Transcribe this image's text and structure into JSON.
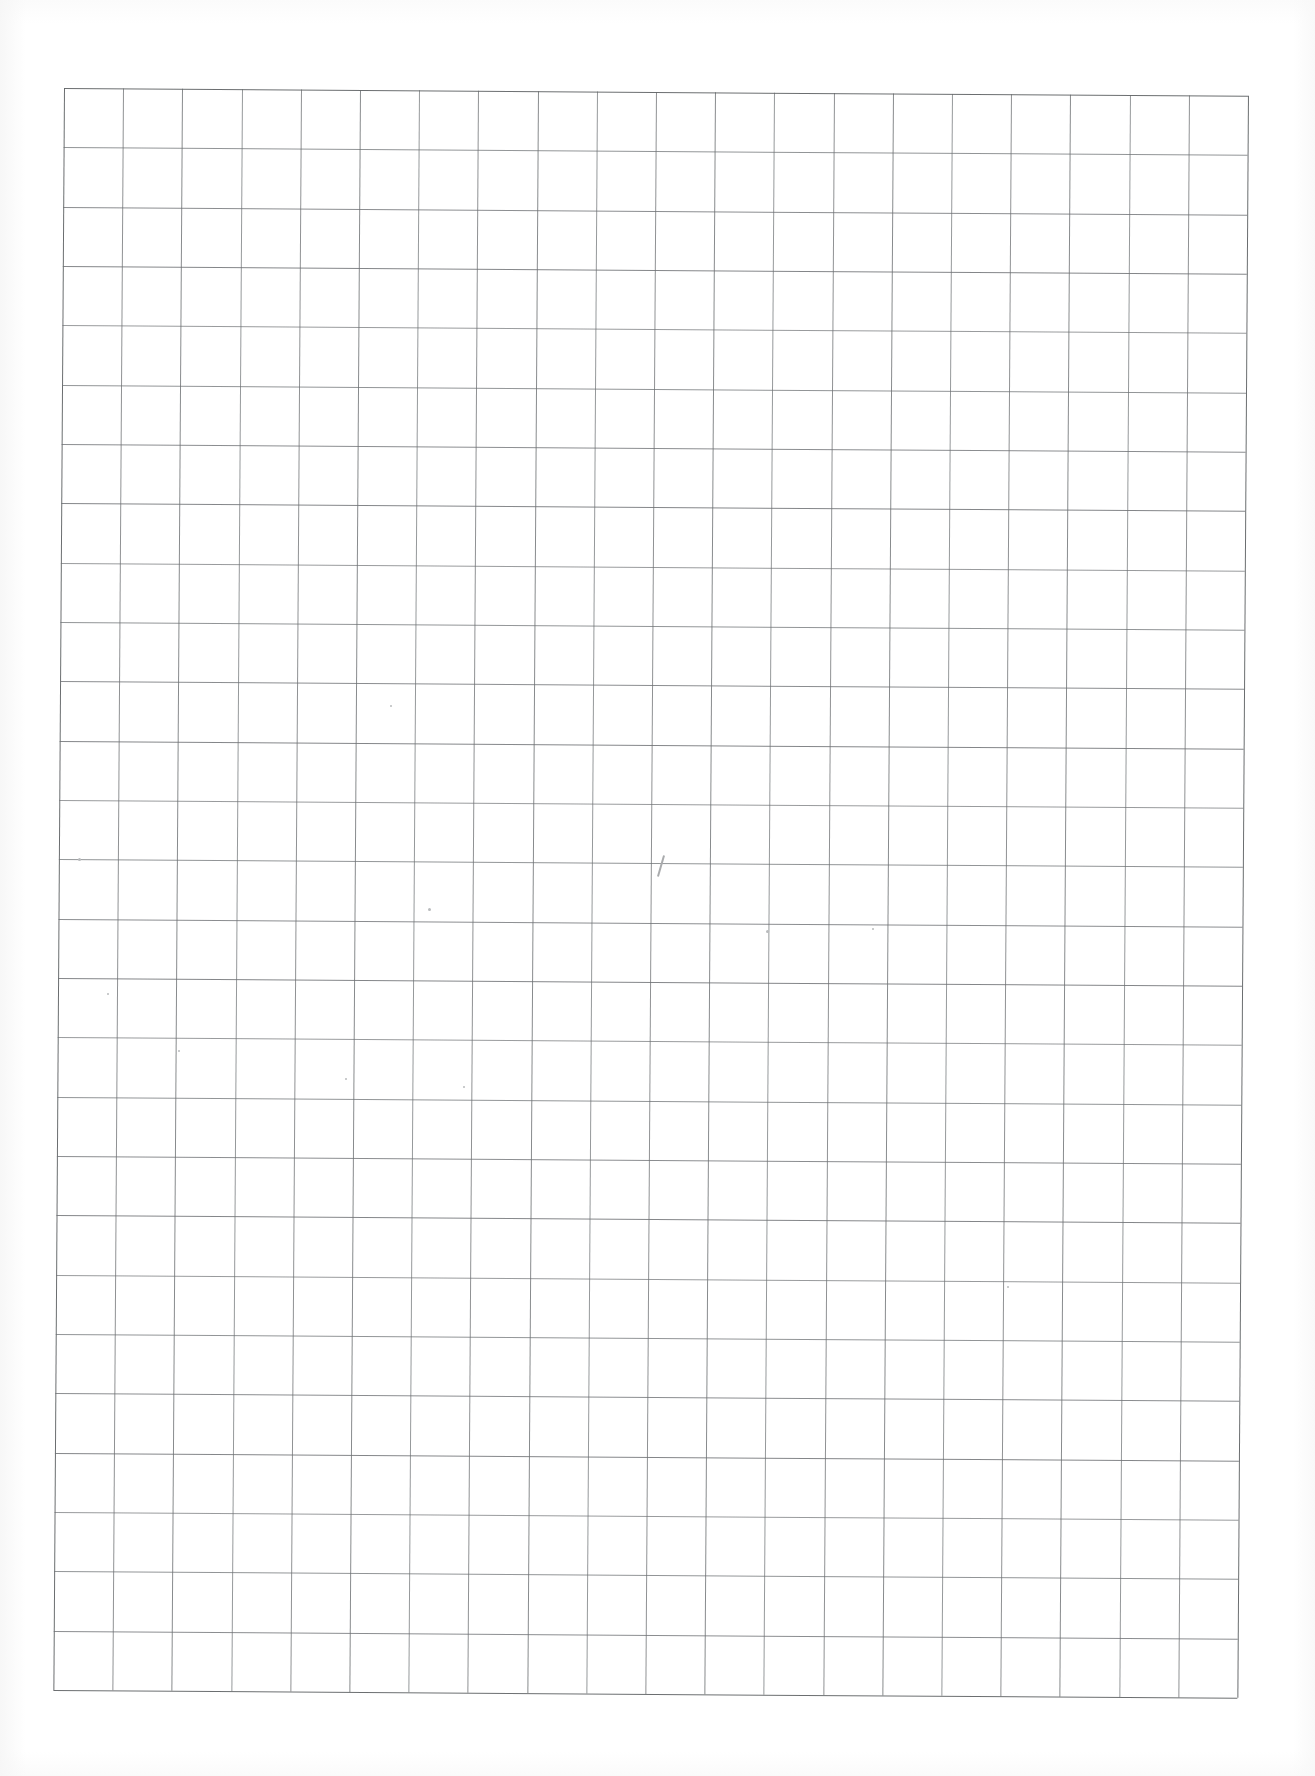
{
  "document": {
    "kind": "scanned-graph-paper",
    "title": "Blank graph paper sheet",
    "caption": "",
    "page_background": "#ffffff",
    "paper_tone": "#fdfdfd"
  },
  "grid": {
    "columns": 20,
    "rows": 27,
    "cell_width_px": 59.2,
    "cell_height_px": 59.3,
    "line_color": "#6e7174",
    "border_color": "#636668",
    "line_width_px": 1,
    "origin_x_px": 64,
    "origin_y_px": 88,
    "width_px": 1184,
    "height_px": 1602,
    "rotation_deg": 0.38
  },
  "artifacts": {
    "specks": [
      {
        "x": 78,
        "y": 858,
        "size": 3
      },
      {
        "x": 428,
        "y": 908,
        "size": 3
      },
      {
        "x": 766,
        "y": 930,
        "size": 3
      },
      {
        "x": 872,
        "y": 928,
        "size": 2
      },
      {
        "x": 107,
        "y": 993,
        "size": 2
      },
      {
        "x": 178,
        "y": 1050,
        "size": 2
      },
      {
        "x": 345,
        "y": 1078,
        "size": 2
      },
      {
        "x": 463,
        "y": 1086,
        "size": 2
      },
      {
        "x": 1007,
        "y": 1286,
        "size": 2
      },
      {
        "x": 390,
        "y": 705,
        "size": 2
      }
    ],
    "marks": [
      {
        "x": 660,
        "y": 855,
        "width": 2,
        "height": 22,
        "rotate": 16
      }
    ]
  },
  "annotations": {
    "text_items": []
  }
}
